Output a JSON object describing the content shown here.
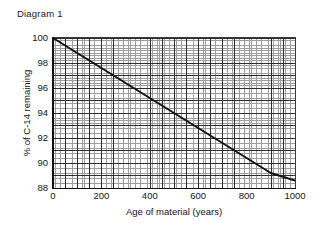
{
  "figure": {
    "title": "Diagram 1",
    "background_color": "#ffffff",
    "line_color": "#111111",
    "grid_minor_color": "#9d9d9d",
    "grid_major_color": "#2e2e2e"
  },
  "chart_data": {
    "type": "line",
    "title": "Diagram 1",
    "subtitle": "",
    "xlabel": "Age of material (years)",
    "ylabel": "% of C-14 remaining",
    "xlim": [
      0,
      1000
    ],
    "ylim": [
      88,
      100
    ],
    "xticks": [
      0,
      200,
      400,
      600,
      800,
      1000
    ],
    "xtick_labels": [
      "0",
      "200",
      "400",
      "600",
      "800",
      "1000"
    ],
    "yticks": [
      88,
      90,
      92,
      94,
      96,
      98,
      100
    ],
    "ytick_labels": [
      "88",
      "90",
      "92",
      "94",
      "96",
      "98",
      "100"
    ],
    "grid": true,
    "grid_minor": true,
    "legend": false,
    "legend_position": "none",
    "annotations": [],
    "series": [
      {
        "name": "C-14 remaining",
        "x": [
          0,
          100,
          200,
          300,
          400,
          500,
          600,
          700,
          800,
          900,
          1000
        ],
        "values": [
          100.0,
          98.8,
          97.6,
          96.4,
          95.2,
          94.0,
          92.8,
          91.6,
          90.4,
          89.2,
          88.6
        ]
      }
    ]
  }
}
